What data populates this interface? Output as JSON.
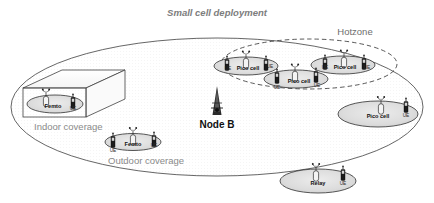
{
  "figure": {
    "title": "Small cell deployment",
    "hotzone_label": "Hotzone",
    "nodeb_label": "Node B",
    "indoor_label": "Indoor coverage",
    "outdoor_label": "Outdoor coverage"
  },
  "colors": {
    "outline": "#4a4a4a",
    "macro_fill": "#fbfbfb",
    "cell_fill": "#d9d9d9",
    "title_text": "#7d7d7d",
    "label_text": "#8a8a8a",
    "dark_text": "#111111",
    "ue_body": "#1c1c1c",
    "bs_fill": "#f2f2f2"
  },
  "cells": {
    "femto_indoor": {
      "name": "Femto",
      "ue": "UE"
    },
    "femto_outdoor": {
      "name": "Femto",
      "ue_left": "UE",
      "ue_right": "UE",
      "ue_below": "UE"
    },
    "pico_hot_left": {
      "name": "Pico cell",
      "ue_left": "UE",
      "ue_right": "UE"
    },
    "pico_hot_mid": {
      "name": "Pico cell",
      "ue_left": "UE",
      "ue_right": "UE",
      "ue_below": "UE"
    },
    "pico_hot_right": {
      "name": "Pico cell",
      "ue_left": "UE",
      "ue_right": "UE"
    },
    "pico_right": {
      "name": "Pico cell",
      "ue": "UE"
    },
    "relay": {
      "name": "Relay",
      "ue": "UE"
    }
  }
}
